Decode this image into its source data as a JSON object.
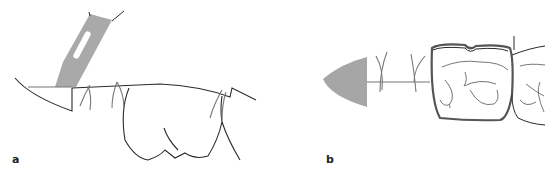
{
  "figure": {
    "panels": [
      {
        "label": "a",
        "description": "Scalpel blade incising gingival tissue along tooth contour with sutures"
      },
      {
        "label": "b",
        "description": "Occlusal view: wedge-shaped tissue excision with sutures adjacent to molar crowns"
      }
    ],
    "colors": {
      "line": "#2a2a2a",
      "suture": "#777777",
      "blade_fill": "#a9a9a9",
      "wedge_fill": "#a6a6a6",
      "background": "#ffffff"
    }
  }
}
